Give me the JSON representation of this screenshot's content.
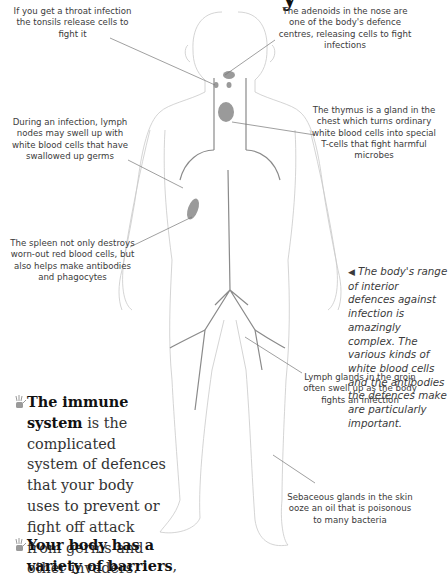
{
  "page": {
    "title_fragment": "y",
    "labels": {
      "tonsils": "If you get a throat infection the tonsils release cells to fight it",
      "adenoids": "The adenoids in the nose are one of the body's defence centres, releasing cells to fight infections",
      "lymph_nodes": "During an infection, lymph nodes may swell up with white blood cells that have swallowed up germs",
      "thymus": "The thymus is a gland in the chest which turns ordinary white blood cells into special T-cells that fight harmful microbes",
      "spleen": "The spleen not only destroys worn-out red blood cells, but also helps make antibodies and phagocytes",
      "groin": "Lymph glands in the groin often swell up as the body fights an infection",
      "sebaceous": "Sebaceous glands in the skin ooze an oil that is poisonous to many bacteria"
    },
    "caption": {
      "arrow": "◀",
      "text": "The body's range of interior defences against infection is amazingly complex. The various kinds of white blood cells and the antibodies the defences make are particularly important."
    },
    "bullets": [
      {
        "icon": "hand-print-icon",
        "bold": "The immune system",
        "text": " is the complicated system of defences that your body uses to prevent or fight off attack from germs and other invaders."
      },
      {
        "icon": "hand-print-icon",
        "bold": "Your body has a variety of barriers",
        "text": ","
      }
    ]
  }
}
